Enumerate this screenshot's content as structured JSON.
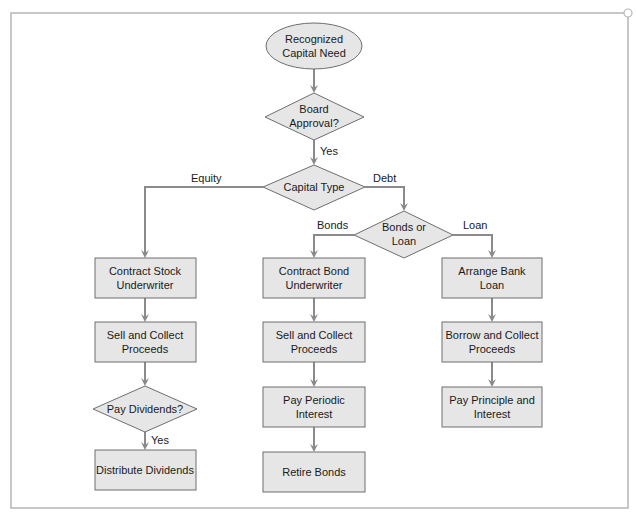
{
  "diagram": {
    "type": "flowchart",
    "colors": {
      "shape_fill": "#e6e6e6",
      "shape_stroke": "#6e6e6e",
      "connector": "#8a8a8a",
      "frame": "#b5b5b5",
      "text": "#1a1a1a"
    },
    "nodes": {
      "start": {
        "shape": "ellipse",
        "lines": [
          "Recognized",
          "Capital Need"
        ]
      },
      "board_approval": {
        "shape": "diamond",
        "lines": [
          "Board",
          "Approval?"
        ]
      },
      "capital_type": {
        "shape": "diamond",
        "lines": [
          "Capital Type"
        ]
      },
      "bonds_or_loan": {
        "shape": "diamond",
        "lines": [
          "Bonds or",
          "Loan"
        ]
      },
      "contract_stock": {
        "shape": "rect",
        "lines": [
          "Contract Stock",
          "Underwriter"
        ]
      },
      "sell_collect_stock": {
        "shape": "rect",
        "lines": [
          "Sell and Collect",
          "Proceeds"
        ]
      },
      "pay_dividends": {
        "shape": "diamond",
        "lines": [
          "Pay Dividends?"
        ]
      },
      "distribute_dividends": {
        "shape": "rect",
        "lines": [
          "Distribute Dividends"
        ]
      },
      "contract_bond": {
        "shape": "rect",
        "lines": [
          "Contract Bond",
          "Underwriter"
        ]
      },
      "sell_collect_bond": {
        "shape": "rect",
        "lines": [
          "Sell and Collect",
          "Proceeds"
        ]
      },
      "pay_periodic_interest": {
        "shape": "rect",
        "lines": [
          "Pay Periodic",
          "Interest"
        ]
      },
      "retire_bonds": {
        "shape": "rect",
        "lines": [
          "Retire Bonds"
        ]
      },
      "arrange_bank_loan": {
        "shape": "rect",
        "lines": [
          "Arrange Bank",
          "Loan"
        ]
      },
      "borrow_collect": {
        "shape": "rect",
        "lines": [
          "Borrow and Collect",
          "Proceeds"
        ]
      },
      "pay_principle_interest": {
        "shape": "rect",
        "lines": [
          "Pay Principle and",
          "Interest"
        ]
      }
    },
    "edge_labels": {
      "approval_yes": "Yes",
      "equity": "Equity",
      "debt": "Debt",
      "bonds": "Bonds",
      "loan": "Loan",
      "dividends_yes": "Yes"
    },
    "edges": [
      {
        "from": "start",
        "to": "board_approval",
        "label": ""
      },
      {
        "from": "board_approval",
        "to": "capital_type",
        "label": "Yes"
      },
      {
        "from": "capital_type",
        "to": "contract_stock",
        "label": "Equity"
      },
      {
        "from": "capital_type",
        "to": "bonds_or_loan",
        "label": "Debt"
      },
      {
        "from": "bonds_or_loan",
        "to": "contract_bond",
        "label": "Bonds"
      },
      {
        "from": "bonds_or_loan",
        "to": "arrange_bank_loan",
        "label": "Loan"
      },
      {
        "from": "contract_stock",
        "to": "sell_collect_stock",
        "label": ""
      },
      {
        "from": "sell_collect_stock",
        "to": "pay_dividends",
        "label": ""
      },
      {
        "from": "pay_dividends",
        "to": "distribute_dividends",
        "label": "Yes"
      },
      {
        "from": "contract_bond",
        "to": "sell_collect_bond",
        "label": ""
      },
      {
        "from": "sell_collect_bond",
        "to": "pay_periodic_interest",
        "label": ""
      },
      {
        "from": "pay_periodic_interest",
        "to": "retire_bonds",
        "label": ""
      },
      {
        "from": "arrange_bank_loan",
        "to": "borrow_collect",
        "label": ""
      },
      {
        "from": "borrow_collect",
        "to": "pay_principle_interest",
        "label": ""
      }
    ]
  }
}
